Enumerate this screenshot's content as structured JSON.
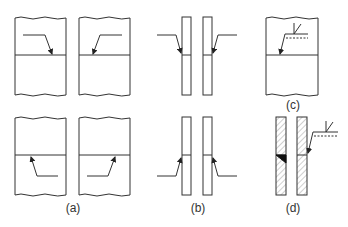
{
  "figure": {
    "panels": [
      {
        "id": "a",
        "label": "(a)",
        "description": "Two plates butt-joined, arrow side and other side arrows pointing to joint, top and bottom variants"
      },
      {
        "id": "b",
        "label": "(b)",
        "description": "Edge view of thin plates with arrows pointing to joint from each side"
      },
      {
        "id": "c",
        "label": "(c)",
        "description": "Plate with weld symbol: reference line, dashed identification line, fillet weld symbol"
      },
      {
        "id": "d",
        "label": "(d)",
        "description": "Sectioned plates with fillet weld (filled triangle) and weld symbol on reference line"
      }
    ],
    "colors": {
      "line": "#333333",
      "weld_fill": "#111111",
      "hatch": "#777777",
      "background": "#ffffff"
    }
  }
}
